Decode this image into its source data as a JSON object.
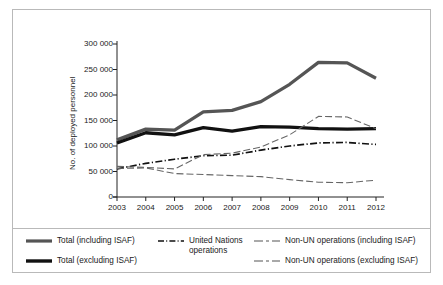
{
  "chart_data": {
    "type": "line",
    "title": "",
    "xlabel": "",
    "ylabel": "No. of deployed personnel",
    "categories": [
      "2003",
      "2004",
      "2005",
      "2006",
      "2007",
      "2008",
      "2009",
      "2010",
      "2011",
      "2012"
    ],
    "x": [
      2003,
      2004,
      2005,
      2006,
      2007,
      2008,
      2009,
      2010,
      2011,
      2012
    ],
    "ylim": [
      0,
      300000
    ],
    "xlim": [
      2003,
      2012
    ],
    "yticks": [
      0,
      50000,
      100000,
      150000,
      200000,
      250000,
      300000
    ],
    "ytick_labels": [
      "0",
      "50 000",
      "100 000",
      "150 000",
      "200 000",
      "250 000",
      "300 000"
    ],
    "grid": false,
    "legend_position": "bottom",
    "series": [
      {
        "name": "Total (including ISAF)",
        "style": "solid-thick",
        "color": "#555555",
        "values": [
          112000,
          133000,
          131000,
          167000,
          170000,
          187000,
          221000,
          264000,
          263000,
          233000
        ]
      },
      {
        "name": "Total (excluding ISAF)",
        "style": "solid-thick",
        "color": "#111111",
        "values": [
          106000,
          126000,
          122000,
          136000,
          129000,
          138000,
          137000,
          134000,
          133000,
          134000
        ]
      },
      {
        "name": "United Nations operations",
        "style": "dash-dot",
        "color": "#111111",
        "values": [
          55000,
          66000,
          74000,
          81000,
          82000,
          92000,
          100000,
          106000,
          107000,
          103000
        ]
      },
      {
        "name": "Non-UN operations (including ISAF)",
        "style": "long-short-dash",
        "color": "#666666",
        "values": [
          60000,
          58000,
          55000,
          83000,
          86000,
          98000,
          122000,
          158000,
          157000,
          134000
        ]
      },
      {
        "name": "Non-UN operations (excluding ISAF)",
        "style": "long-short-dash",
        "color": "#666666",
        "values": [
          56000,
          57000,
          46000,
          44000,
          42000,
          40000,
          34000,
          29000,
          28000,
          33000
        ]
      }
    ]
  },
  "axes": {
    "y_title": "No. of deployed personnel",
    "y_ticks": [
      "300 000",
      "250 000",
      "200 000",
      "150 000",
      "100 000",
      "50 000",
      "0"
    ],
    "x_ticks": [
      "2003",
      "2004",
      "2005",
      "2006",
      "2007",
      "2008",
      "2009",
      "2010",
      "2011",
      "2012"
    ]
  },
  "legend": {
    "column1": [
      {
        "label": "Total (including ISAF)",
        "swatch": "solid-gray-thick"
      },
      {
        "label": "Total (excluding ISAF)",
        "swatch": "solid-black-thick"
      }
    ],
    "column2": [
      {
        "label": "United Nations",
        "label2": "operations",
        "swatch": "dash-dot-black"
      }
    ],
    "column3": [
      {
        "label": "Non-UN operations (including ISAF)",
        "swatch": "long-short-dash-gray"
      },
      {
        "label": "Non-UN operations (excluding ISAF)",
        "swatch": "long-short-dash-gray"
      }
    ]
  },
  "colors": {
    "total_including": "#555555",
    "total_excluding": "#111111",
    "un_operations": "#111111",
    "non_un": "#666666",
    "frame": "#b9b9b9",
    "axis": "#222222"
  }
}
